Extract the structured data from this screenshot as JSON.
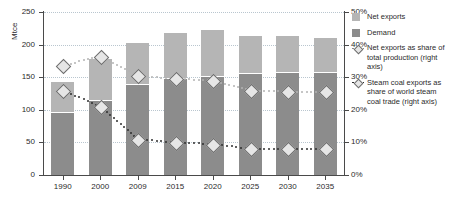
{
  "chart_data": {
    "type": "bar",
    "title": "",
    "subtitle": "",
    "xlabel": "",
    "ylabel": "Mtce",
    "y2label": "",
    "ylim": [
      0,
      250
    ],
    "y2lim": [
      0,
      50
    ],
    "yticks": [
      "0",
      "50",
      "100",
      "150",
      "200",
      "250"
    ],
    "y2ticks": [
      "0%",
      "10%",
      "20%",
      "30%",
      "40%",
      "50%"
    ],
    "grid": true,
    "legend_position": "right",
    "categories": [
      "1990",
      "2000",
      "2009",
      "2015",
      "2020",
      "2025",
      "2030",
      "2035"
    ],
    "series": [
      {
        "name": "Demand",
        "type": "bar",
        "axis": "left",
        "unit": "Mtce",
        "color": "#8c8c8c",
        "values": [
          95,
          113,
          138,
          148,
          151,
          155,
          157,
          157
        ]
      },
      {
        "name": "Net exports",
        "type": "bar",
        "axis": "left",
        "unit": "Mtce",
        "color": "#b5b5b5",
        "values": [
          48,
          65,
          64,
          70,
          71,
          58,
          56,
          53
        ]
      },
      {
        "name": "Total (stacked)",
        "type": "bar-total",
        "axis": "left",
        "unit": "Mtce",
        "values": [
          143,
          178,
          202,
          218,
          222,
          213,
          213,
          210
        ]
      },
      {
        "name": "Net exports as share of total production (right axis)",
        "type": "line",
        "axis": "right",
        "unit": "%",
        "color": "#b3b3b3",
        "values": [
          33.5,
          36.5,
          30.5,
          29.5,
          29.0,
          26.0,
          25.5,
          25.5
        ]
      },
      {
        "name": "Steam coal exports as share of world steam coal trade (right axis)",
        "type": "line",
        "axis": "right",
        "unit": "%",
        "color": "#2e2e2e",
        "values": [
          26.0,
          21.0,
          11.0,
          10.0,
          9.5,
          8.0,
          8.0,
          8.0
        ]
      }
    ]
  },
  "axes": {
    "left_title": "Mtce",
    "left_ticks": [
      "250",
      "200",
      "150",
      "100",
      "50",
      "0"
    ],
    "right_ticks": [
      "50%",
      "40%",
      "30%",
      "20%",
      "10%",
      "0%"
    ],
    "x_ticks": [
      "1990",
      "2000",
      "2009",
      "2015",
      "2020",
      "2025",
      "2030",
      "2035"
    ]
  },
  "legend": {
    "items": [
      {
        "label": "Net exports",
        "icon": "square-swatch",
        "color": "#b5b5b5"
      },
      {
        "label": "Demand",
        "icon": "square-swatch",
        "color": "#8c8c8c"
      },
      {
        "label": "Net exports as share of total production (right axis)",
        "icon": "dotted-diamond-marker",
        "color": "#b3b3b3"
      },
      {
        "label": "Steam coal exports as share of world steam coal trade (right axis)",
        "icon": "dotted-diamond-marker",
        "color": "#2e2e2e"
      }
    ]
  }
}
